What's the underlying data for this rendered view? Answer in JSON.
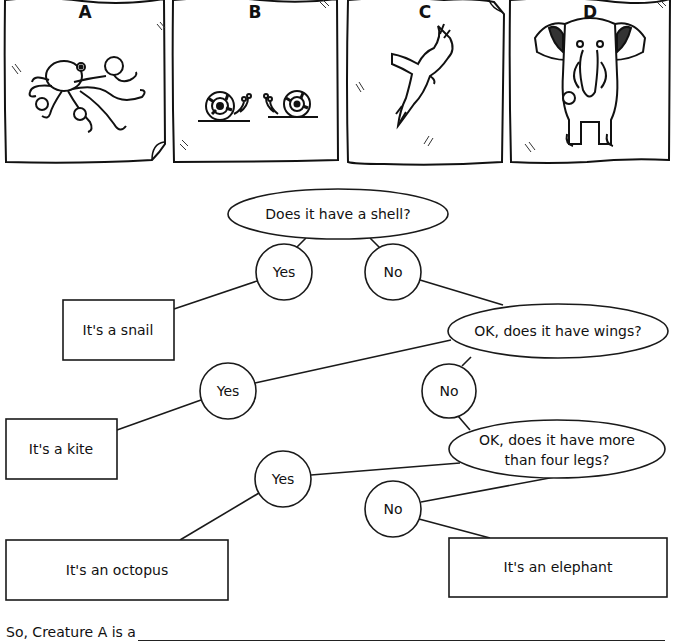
{
  "panels": [
    {
      "label": "A",
      "creature": "octopus"
    },
    {
      "label": "B",
      "creature": "snails"
    },
    {
      "label": "C",
      "creature": "kite (bird)"
    },
    {
      "label": "D",
      "creature": "elephant"
    }
  ],
  "key": {
    "q1": "Does it have a shell?",
    "q2": "OK, does it have wings?",
    "q3_line1": "OK, does it have more",
    "q3_line2": "than four legs?",
    "yes": "Yes",
    "no": "No",
    "result_snail": "It's a snail",
    "result_kite": "It's a kite",
    "result_octopus": "It's an octopus",
    "result_elephant": "It's an elephant"
  },
  "answer": {
    "prompt": "So, Creature A is a",
    "value": ""
  },
  "colors": {
    "line": "#1a1a1a",
    "background": "#ffffff"
  }
}
